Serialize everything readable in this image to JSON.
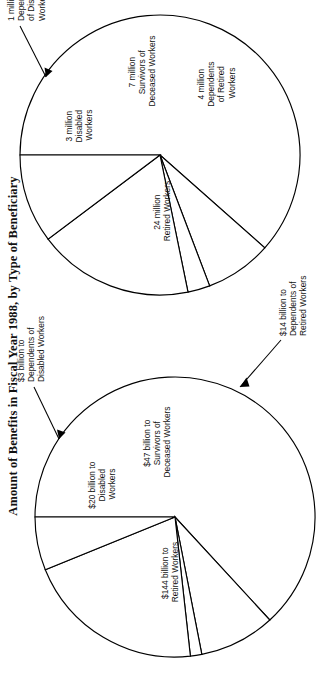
{
  "page": {
    "title": "Amount of Benefits in Fiscal Year 1988, by Type of Beneficiary",
    "orientation": "rotated-90-ccw",
    "background": "#ffffff",
    "ink": "#000000"
  },
  "chart_data": [
    {
      "type": "pie",
      "id": "beneficiaries-pie",
      "title": "",
      "unit": "million beneficiaries",
      "total": 39,
      "legend": "none",
      "start_angle_deg": -90,
      "direction": "clockwise",
      "categories": [
        "Retired Workers",
        "Disabled Workers",
        "Dependents of Disabled Workers",
        "Survivors of Deceased Workers",
        "Dependents of Retired Workers"
      ],
      "values": [
        24,
        3,
        1,
        7,
        4
      ],
      "slices": [
        {
          "key": "retired-workers",
          "value": 24,
          "label_line1": "24 million",
          "label_line2": "Retired Workers",
          "label_line3": "",
          "leader": false
        },
        {
          "key": "disabled-workers",
          "value": 3,
          "label_line1": "3 million",
          "label_line2": "Disabled",
          "label_line3": "Workers",
          "leader": false
        },
        {
          "key": "dependents-disabled-workers",
          "value": 1,
          "label_line1": "1 million",
          "label_line2": "Dependents",
          "label_line3": "of Disabled",
          "label_line4": "Workers",
          "leader": true
        },
        {
          "key": "survivors-deceased-workers",
          "value": 7,
          "label_line1": "7 million",
          "label_line2": "Survivors of",
          "label_line3": "Deceased Workers",
          "leader": false
        },
        {
          "key": "dependents-retired-workers",
          "value": 4,
          "label_line1": "4 million",
          "label_line2": "Dependents",
          "label_line3": "of Retired",
          "label_line4": "Workers",
          "leader": false
        }
      ]
    },
    {
      "type": "pie",
      "id": "amounts-pie",
      "title": "",
      "unit": "billion dollars",
      "total": 228,
      "legend": "none",
      "start_angle_deg": -90,
      "direction": "clockwise",
      "categories": [
        "Retired Workers",
        "Disabled Workers",
        "Dependents of Disabled Workers",
        "Survivors of Deceased Workers",
        "Dependents of Retired Workers"
      ],
      "values": [
        144,
        20,
        3,
        47,
        14
      ],
      "slices": [
        {
          "key": "retired-workers",
          "value": 144,
          "label_line1": "$144 billion to",
          "label_line2": "Retired Workers",
          "label_line3": "",
          "leader": false
        },
        {
          "key": "disabled-workers",
          "value": 20,
          "label_line1": "$20 billion to",
          "label_line2": "Disabled",
          "label_line3": "Workers",
          "leader": false
        },
        {
          "key": "dependents-disabled-workers",
          "value": 3,
          "label_line1": "$3 billion to",
          "label_line2": "Dependents of",
          "label_line3": "Disabled Workers",
          "leader": true
        },
        {
          "key": "survivors-deceased-workers",
          "value": 47,
          "label_line1": "$47 billion to",
          "label_line2": "Survivors of",
          "label_line3": "Deceased Workers",
          "leader": false
        },
        {
          "key": "dependents-retired-workers",
          "value": 14,
          "label_line1": "$14 billion to",
          "label_line2": "Dependents of",
          "label_line3": "Retired Workers",
          "leader": true
        }
      ]
    }
  ]
}
